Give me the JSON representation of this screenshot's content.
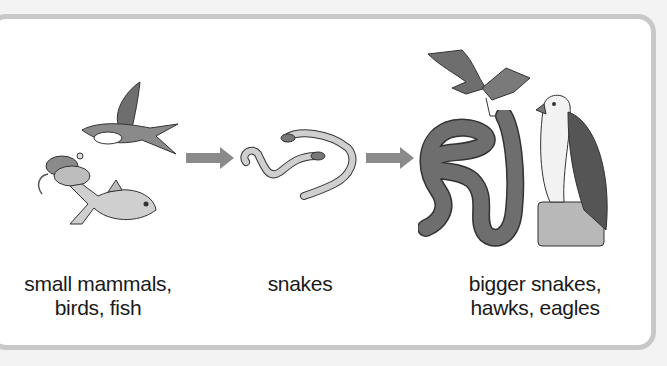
{
  "diagram": {
    "type": "food-chain",
    "stages": [
      {
        "id": "prey",
        "label_line1": "small mammals,",
        "label_line2": "birds, fish",
        "icons": [
          "mouse-icon",
          "swallow-icon",
          "fish-icon"
        ]
      },
      {
        "id": "snakes",
        "label_line1": "snakes",
        "icons": [
          "small-snake-icon",
          "small-snake-icon"
        ]
      },
      {
        "id": "predators",
        "label_line1": "bigger snakes,",
        "label_line2": "hawks, eagles",
        "icons": [
          "hawk-icon",
          "large-snake-icon",
          "eagle-icon"
        ]
      }
    ],
    "arrows": [
      {
        "from": "prey",
        "to": "snakes"
      },
      {
        "from": "snakes",
        "to": "predators"
      }
    ],
    "colors": {
      "arrow": "#8a8a8a",
      "panel_border": "#c8c8c8",
      "background": "#f3f3f3"
    }
  }
}
